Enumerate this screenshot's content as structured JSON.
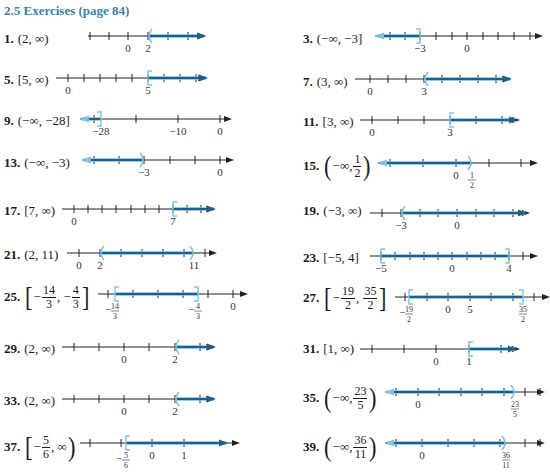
{
  "header": {
    "title": "2.5 Exercises (page 84)"
  },
  "colors": {
    "accent": "#3a7fb0",
    "ray": "#1f5f85",
    "highlight": "#7ec3e6",
    "axis": "#222222"
  },
  "exercises": [
    {
      "num": "1.",
      "answer": "(2, ∞)",
      "x": 4,
      "y": 31,
      "line": {
        "x": 88,
        "y": 36,
        "w": 118,
        "ticks": [
          90,
          109,
          128,
          148,
          168,
          188
        ],
        "labels": [
          {
            "x": 128,
            "t": "0"
          },
          {
            "x": 148,
            "t": "2"
          }
        ],
        "shade": [
          148,
          204
        ],
        "end": {
          "x": 148,
          "type": "("
        },
        "dir": "right"
      }
    },
    {
      "num": "3.",
      "answer": "(−∞, −3]",
      "x": 303,
      "y": 31,
      "line": {
        "x": 375,
        "y": 36,
        "w": 168,
        "ticks": [
          390,
          405,
          420,
          436,
          452,
          467,
          483,
          498,
          514,
          530
        ],
        "labels": [
          {
            "x": 420,
            "t": "−3"
          },
          {
            "x": 467,
            "t": "0"
          }
        ],
        "shade": [
          377,
          420
        ],
        "end": {
          "x": 420,
          "type": "]"
        },
        "dir": "left"
      }
    },
    {
      "num": "5.",
      "answer": "[5, ∞)",
      "x": 4,
      "y": 72,
      "line": {
        "x": 56,
        "y": 78,
        "w": 150,
        "ticks": [
          68,
          84,
          100,
          116,
          132,
          148,
          164,
          180,
          196
        ],
        "labels": [
          {
            "x": 68,
            "t": "0"
          },
          {
            "x": 148,
            "t": "5"
          }
        ],
        "shade": [
          148,
          206
        ],
        "end": {
          "x": 148,
          "type": "["
        },
        "dir": "right"
      }
    },
    {
      "num": "7.",
      "answer": "(3, ∞)",
      "x": 303,
      "y": 74,
      "line": {
        "x": 355,
        "y": 79,
        "w": 155,
        "ticks": [
          370,
          388,
          406,
          424,
          442,
          460,
          478,
          496
        ],
        "labels": [
          {
            "x": 370,
            "t": "0"
          },
          {
            "x": 424,
            "t": "3"
          }
        ],
        "shade": [
          424,
          510
        ],
        "end": {
          "x": 424,
          "type": "("
        },
        "dir": "right"
      }
    },
    {
      "num": "9.",
      "answer": "(−∞, −28]",
      "x": 4,
      "y": 113,
      "line": {
        "x": 80,
        "y": 119,
        "w": 152,
        "ticks": [
          94,
          136,
          178,
          220
        ],
        "labels": [
          {
            "x": 101,
            "t": "−28"
          },
          {
            "x": 178,
            "t": "−10"
          },
          {
            "x": 220,
            "t": "0"
          }
        ],
        "shade": [
          82,
          101
        ],
        "end": {
          "x": 101,
          "type": "]"
        },
        "dir": "left"
      }
    },
    {
      "num": "11.",
      "answer": "[3, ∞)",
      "x": 303,
      "y": 114,
      "line": {
        "x": 360,
        "y": 120,
        "w": 160,
        "ticks": [
          372,
          398,
          424,
          450,
          476,
          502
        ],
        "labels": [
          {
            "x": 372,
            "t": "0"
          },
          {
            "x": 450,
            "t": "3"
          }
        ],
        "shade": [
          450,
          516
        ],
        "end": {
          "x": 450,
          "type": "["
        },
        "dir": "right"
      }
    },
    {
      "num": "13.",
      "answer": "(−∞, −3)",
      "x": 4,
      "y": 155,
      "line": {
        "x": 82,
        "y": 160,
        "w": 152,
        "ticks": [
          94,
          119,
          144,
          170,
          195,
          220
        ],
        "labels": [
          {
            "x": 144,
            "t": "−3"
          },
          {
            "x": 220,
            "t": "0"
          }
        ],
        "shade": [
          84,
          144
        ],
        "end": {
          "x": 144,
          "type": ")"
        },
        "dir": "left"
      }
    },
    {
      "num": "15.",
      "answer_parts": [
        "(−∞, ",
        "1",
        "2",
        ")"
      ],
      "frac": true,
      "x": 303,
      "y": 152,
      "line": {
        "x": 378,
        "y": 163,
        "w": 160,
        "ticks": [
          390,
          423,
          456,
          489,
          521
        ],
        "labels": [
          {
            "x": 456,
            "t": "0"
          }
        ],
        "fraclabels": [
          {
            "x": 472,
            "n": "1",
            "d": "2"
          }
        ],
        "shade": [
          380,
          472
        ],
        "end": {
          "x": 472,
          "type": ")"
        },
        "dir": "left"
      }
    },
    {
      "num": "17.",
      "answer": "[7, ∞)",
      "x": 4,
      "y": 203,
      "line": {
        "x": 62,
        "y": 209,
        "w": 152,
        "ticks": [
          74,
          88,
          102,
          116,
          131,
          145,
          159,
          173,
          187,
          201
        ],
        "labels": [
          {
            "x": 74,
            "t": "0"
          },
          {
            "x": 173,
            "t": "7"
          }
        ],
        "shade": [
          173,
          214
        ],
        "end": {
          "x": 173,
          "type": "["
        },
        "dir": "right"
      }
    },
    {
      "num": "19.",
      "answer": "(−3, ∞)",
      "x": 303,
      "y": 203,
      "line": {
        "x": 370,
        "y": 213,
        "w": 160,
        "ticks": [
          382,
          401,
          420,
          438,
          457,
          476,
          494,
          513
        ],
        "labels": [
          {
            "x": 401,
            "t": "−3"
          },
          {
            "x": 457,
            "t": "0"
          }
        ],
        "shade": [
          401,
          525
        ],
        "end": {
          "x": 401,
          "type": "("
        },
        "dir": "right"
      }
    },
    {
      "num": "21.",
      "answer": "(2, 11)",
      "x": 4,
      "y": 247,
      "line": {
        "x": 67,
        "y": 253,
        "w": 150,
        "ticks": [
          79,
          100,
          121,
          142,
          163,
          184,
          205
        ],
        "labels": [
          {
            "x": 79,
            "t": "0"
          },
          {
            "x": 100,
            "t": "2"
          },
          {
            "x": 194,
            "t": "11"
          }
        ],
        "shade": [
          100,
          194
        ],
        "end": {
          "x": 100,
          "type": "("
        },
        "end2": {
          "x": 194,
          "type": ")"
        },
        "dir": "right"
      }
    },
    {
      "num": "23.",
      "answer": "[−5, 4]",
      "x": 303,
      "y": 250,
      "line": {
        "x": 370,
        "y": 256,
        "w": 168,
        "ticks": [
          381,
          395,
          410,
          424,
          438,
          452,
          467,
          481,
          495,
          509,
          523
        ],
        "labels": [
          {
            "x": 381,
            "t": "−5"
          },
          {
            "x": 452,
            "t": "0"
          },
          {
            "x": 509,
            "t": "4"
          }
        ],
        "shade": [
          381,
          509
        ],
        "end": {
          "x": 381,
          "type": "["
        },
        "end2": {
          "x": 509,
          "type": "]"
        },
        "dir": "right"
      }
    },
    {
      "num": "25.",
      "answer_parts": [
        "−14",
        "3",
        "−4",
        "3"
      ],
      "type": "closed2",
      "x": 4,
      "y": 283,
      "line": {
        "x": 98,
        "y": 294,
        "w": 150,
        "ticks": [
          108,
          133,
          158,
          183,
          208,
          233
        ],
        "labels": [
          {
            "x": 233,
            "t": "0"
          }
        ],
        "fraclabels": [
          {
            "x": 115,
            "n": "14",
            "d": "3",
            "neg": true
          },
          {
            "x": 198,
            "n": "4",
            "d": "3",
            "neg": true
          }
        ],
        "shade": [
          115,
          198
        ],
        "end": {
          "x": 115,
          "type": "["
        },
        "end2": {
          "x": 198,
          "type": "]"
        },
        "dir": "right"
      }
    },
    {
      "num": "27.",
      "answer_parts": [
        "−19",
        "2",
        "35",
        "2"
      ],
      "type": "closed2",
      "x": 303,
      "y": 284,
      "line": {
        "x": 395,
        "y": 297,
        "w": 155,
        "ticks": [
          405,
          427,
          448,
          470,
          491,
          513,
          534
        ],
        "labels": [
          {
            "x": 448,
            "t": "0"
          },
          {
            "x": 470,
            "t": "5"
          }
        ],
        "fraclabels": [
          {
            "x": 409,
            "n": "19",
            "d": "2",
            "neg": true
          },
          {
            "x": 523,
            "n": "35",
            "d": "2"
          }
        ],
        "shade": [
          409,
          523
        ],
        "end": {
          "x": 409,
          "type": "["
        },
        "end2": {
          "x": 523,
          "type": "]"
        },
        "dir": "right"
      }
    },
    {
      "num": "29.",
      "answer": "(2, ∞)",
      "x": 4,
      "y": 341,
      "line": {
        "x": 62,
        "y": 347,
        "w": 152,
        "ticks": [
          74,
          99,
          124,
          149,
          175,
          200
        ],
        "labels": [
          {
            "x": 124,
            "t": "0"
          },
          {
            "x": 175,
            "t": "2"
          }
        ],
        "shade": [
          175,
          214
        ],
        "end": {
          "x": 175,
          "type": "("
        },
        "dir": "right"
      }
    },
    {
      "num": "31.",
      "answer": "[1, ∞)",
      "x": 303,
      "y": 341,
      "line": {
        "x": 360,
        "y": 349,
        "w": 160,
        "ticks": [
          372,
          404,
          436,
          469,
          501
        ],
        "labels": [
          {
            "x": 436,
            "t": "0"
          },
          {
            "x": 469,
            "t": "1"
          }
        ],
        "shade": [
          469,
          515
        ],
        "end": {
          "x": 469,
          "type": "["
        },
        "dir": "right"
      }
    },
    {
      "num": "33.",
      "answer": "(2, ∞)",
      "x": 4,
      "y": 393,
      "line": {
        "x": 62,
        "y": 399,
        "w": 152,
        "ticks": [
          74,
          99,
          124,
          149,
          175,
          200
        ],
        "labels": [
          {
            "x": 124,
            "t": "0"
          },
          {
            "x": 175,
            "t": "2"
          }
        ],
        "shade": [
          175,
          214
        ],
        "end": {
          "x": 175,
          "type": "("
        },
        "dir": "right"
      }
    },
    {
      "num": "35.",
      "answer_parts": [
        "(−∞, ",
        "23",
        "5",
        ")"
      ],
      "frac": true,
      "x": 303,
      "y": 384,
      "line": {
        "x": 385,
        "y": 392,
        "w": 160,
        "ticks": [
          396,
          418,
          439,
          461,
          482,
          504,
          525,
          540
        ],
        "labels": [
          {
            "x": 418,
            "t": "0"
          }
        ],
        "fraclabels": [
          {
            "x": 515,
            "n": "23",
            "d": "5"
          }
        ],
        "shade": [
          387,
          515
        ],
        "end": {
          "x": 515,
          "type": ")"
        },
        "dir": "left"
      }
    },
    {
      "num": "37.",
      "answer_parts": [
        "−5",
        "6"
      ],
      "type": "halfopen",
      "x": 4,
      "y": 433,
      "line": {
        "x": 80,
        "y": 443,
        "w": 160,
        "ticks": [
          90,
          121,
          152,
          184
        ],
        "labels": [
          {
            "x": 152,
            "t": "0"
          },
          {
            "x": 184,
            "t": "1"
          }
        ],
        "fraclabels": [
          {
            "x": 126,
            "n": "5",
            "d": "6",
            "neg": true
          }
        ],
        "shade": [
          126,
          226
        ],
        "end": {
          "x": 126,
          "type": "["
        },
        "dir": "right"
      }
    },
    {
      "num": "39.",
      "answer_parts": [
        "(−∞, ",
        "36",
        "11",
        ")"
      ],
      "frac": true,
      "x": 303,
      "y": 433,
      "line": {
        "x": 385,
        "y": 443,
        "w": 160,
        "ticks": [
          396,
          422,
          448,
          474,
          500,
          525,
          540
        ],
        "labels": [
          {
            "x": 422,
            "t": "0"
          }
        ],
        "fraclabels": [
          {
            "x": 506,
            "n": "36",
            "d": "11"
          }
        ],
        "shade": [
          387,
          506
        ],
        "end": {
          "x": 506,
          "type": ")"
        },
        "dir": "left"
      }
    }
  ]
}
